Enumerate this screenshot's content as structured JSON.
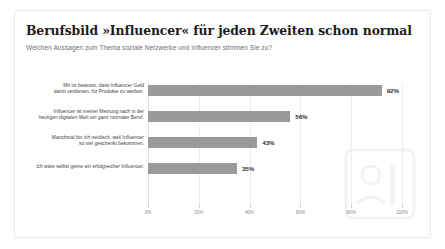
{
  "card": {
    "title": "Berufsbild »Influencer« für jeden Zweiten schon normal",
    "subtitle": "Welchen Aussagen zum Thema soziale Netzwerke und Influencer stimmen Sie zu?"
  },
  "colors": {
    "bar": "#9a9a9a",
    "grid": "#ececec",
    "title": "#1b1b1b",
    "subtitle": "#6f6f6f",
    "label": "#3d3d3d",
    "tick": "#8a8a8a",
    "card_border": "#e9e9e9",
    "watermark": "#f4f4f4"
  },
  "watermark": {
    "icon_name": "statista-logo-watermark"
  },
  "chart_data": {
    "type": "bar",
    "orientation": "horizontal",
    "title": "Berufsbild »Influencer« für jeden Zweiten schon normal",
    "subtitle": "Welchen Aussagen zum Thema soziale Netzwerke und Influencer stimmen Sie zu?",
    "xlabel": "",
    "ylabel": "",
    "xlim": [
      0,
      100
    ],
    "grid": true,
    "legend": false,
    "categories": [
      "Mir ist bewusst, dass Influencer Geld damit verdienen, für Produkte zu werben.",
      "Influencer ist meiner Meinung nach in der heutigen digitalen Welt ein ganz normaler Beruf.",
      "Manchmal bin ich neidisch, weil Influencer so viel geschenkt bekommen.",
      "Ich wäre selbst gerne ein erfolgreicher Influencer."
    ],
    "values": [
      92,
      56,
      43,
      35
    ],
    "value_labels": [
      "92%",
      "56%",
      "43%",
      "35%"
    ],
    "xticks": [
      0,
      20,
      40,
      60,
      80,
      100
    ],
    "xtick_labels": [
      "0%",
      "20%",
      "40%",
      "60%",
      "80%",
      "100%"
    ]
  },
  "rows": [
    {
      "label_line1": "Mir ist bewusst, dass Influencer Geld",
      "label_line2": "damit verdienen, für Produkte zu werben.",
      "value_label": "92%"
    },
    {
      "label_line1": "Influencer ist meiner Meinung nach in der",
      "label_line2": "heutigen digitalen Welt ein ganz normaler Beruf.",
      "value_label": "56%"
    },
    {
      "label_line1": "Manchmal bin ich neidisch, weil Influencer",
      "label_line2": "so viel geschenkt bekommen.",
      "value_label": "43%"
    },
    {
      "label_line1": "Ich wäre selbst gerne ein erfolgreicher Influencer.",
      "label_line2": "",
      "value_label": "35%"
    }
  ],
  "xticks": [
    {
      "label": "0%"
    },
    {
      "label": "20%"
    },
    {
      "label": "40%"
    },
    {
      "label": "60%"
    },
    {
      "label": "80%"
    },
    {
      "label": "100%"
    }
  ]
}
